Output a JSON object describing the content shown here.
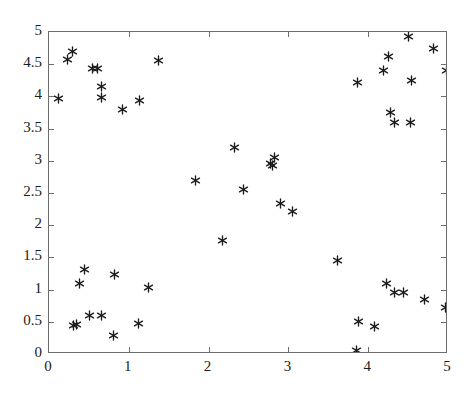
{
  "chart_data": {
    "type": "scatter",
    "title": "",
    "xlabel": "",
    "ylabel": "",
    "xlim": [
      0,
      5
    ],
    "ylim": [
      0,
      5
    ],
    "xticks": [
      "0",
      "1",
      "2",
      "3",
      "4",
      "5"
    ],
    "xtick_values": [
      0,
      1,
      2,
      3,
      4,
      5
    ],
    "yticks": [
      "0",
      "0.5",
      "1",
      "1.5",
      "2",
      "2.5",
      "3",
      "3.5",
      "4",
      "4.5",
      "5"
    ],
    "ytick_values": [
      0,
      0.5,
      1,
      1.5,
      2,
      2.5,
      3,
      3.5,
      4,
      4.5,
      5
    ],
    "grid": false,
    "legend": null,
    "marker": "asterisk",
    "marker_color": "#1b1b1b",
    "box": true,
    "series": [
      {
        "name": "points",
        "points": [
          [
            0.12,
            3.96
          ],
          [
            0.23,
            4.57
          ],
          [
            0.3,
            4.69
          ],
          [
            0.55,
            4.43
          ],
          [
            0.61,
            4.43
          ],
          [
            0.66,
            4.16
          ],
          [
            0.66,
            3.99
          ],
          [
            0.92,
            3.79
          ],
          [
            1.14,
            3.93
          ],
          [
            1.37,
            4.55
          ],
          [
            1.84,
            2.7
          ],
          [
            2.32,
            3.2
          ],
          [
            2.44,
            2.56
          ],
          [
            2.77,
            2.96
          ],
          [
            2.82,
            3.05
          ],
          [
            2.8,
            2.93
          ],
          [
            2.9,
            2.33
          ],
          [
            3.05,
            2.21
          ],
          [
            3.62,
            1.45
          ],
          [
            3.86,
            4.22
          ],
          [
            4.19,
            4.4
          ],
          [
            4.25,
            4.62
          ],
          [
            4.5,
            4.93
          ],
          [
            4.82,
            4.75
          ],
          [
            4.98,
            4.4
          ],
          [
            4.54,
            4.25
          ],
          [
            4.28,
            3.75
          ],
          [
            4.33,
            3.6
          ],
          [
            4.53,
            3.6
          ],
          [
            0.31,
            0.44
          ],
          [
            0.35,
            0.46
          ],
          [
            0.38,
            1.09
          ],
          [
            0.44,
            1.31
          ],
          [
            0.51,
            0.6
          ],
          [
            0.66,
            0.6
          ],
          [
            0.81,
            0.28
          ],
          [
            0.82,
            1.24
          ],
          [
            1.12,
            0.48
          ],
          [
            1.25,
            1.04
          ],
          [
            2.18,
            1.77
          ],
          [
            3.85,
            0.05
          ],
          [
            3.88,
            0.51
          ],
          [
            4.08,
            0.42
          ],
          [
            4.23,
            1.1
          ],
          [
            4.33,
            0.96
          ],
          [
            4.44,
            0.96
          ],
          [
            4.7,
            0.85
          ],
          [
            4.97,
            0.72
          ]
        ]
      }
    ]
  }
}
